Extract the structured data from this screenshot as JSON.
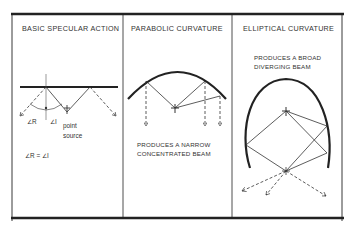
{
  "panels": [
    {
      "title": "BASIC SPECULAR ACTION",
      "labels": {
        "angle_r": "∠R",
        "angle_i": "∠I",
        "point": "point",
        "source": "source",
        "equation": "∠R = ∠I"
      }
    },
    {
      "title": "PARABOLIC CURVATURE",
      "caption_line1": "PRODUCES A NARROW",
      "caption_line2": "CONCENTRATED BEAM"
    },
    {
      "title": "ELLIPTICAL CURVATURE",
      "caption_line1": "PRODUCES A BROAD",
      "caption_line2": "DIVERGING BEAM"
    }
  ],
  "colors": {
    "ink": "#222222",
    "background": "#ffffff"
  }
}
